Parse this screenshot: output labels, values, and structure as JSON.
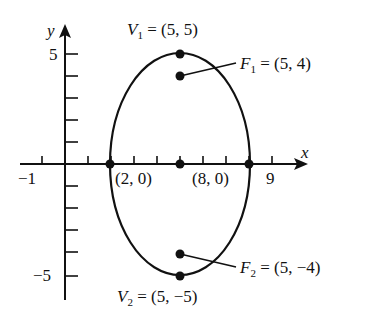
{
  "diagram": {
    "type": "ellipse-on-axes",
    "axes": {
      "x_label": "x",
      "y_label": "y",
      "x_tick_labels": [
        {
          "value": -1,
          "text": "−1"
        },
        {
          "value": 9,
          "text": "9"
        }
      ],
      "y_tick_labels": [
        {
          "value": 5,
          "text": "5"
        },
        {
          "value": -5,
          "text": "−5"
        }
      ],
      "x_range": [
        -1,
        9
      ],
      "y_range": [
        -5,
        5
      ]
    },
    "ellipse": {
      "center": [
        5,
        0
      ],
      "semi_major_vertical": 5,
      "semi_minor_horizontal": 3
    },
    "points": {
      "V1": {
        "label_var": "V",
        "label_sub": "1",
        "label_rest": " = (5, 5)",
        "x": 5,
        "y": 5
      },
      "F1": {
        "label_var": "F",
        "label_sub": "1",
        "label_rest": " = (5, 4)",
        "x": 5,
        "y": 4
      },
      "F2": {
        "label_var": "F",
        "label_sub": "2",
        "label_rest": " = (5, −4)",
        "x": 5,
        "y": -4
      },
      "V2": {
        "label_var": "V",
        "label_sub": "2",
        "label_rest": " = (5, −5)",
        "x": 5,
        "y": -5
      },
      "left": {
        "label": "(2, 0)",
        "x": 2,
        "y": 0
      },
      "right": {
        "label": "(8, 0)",
        "x": 8,
        "y": 0
      },
      "center": {
        "x": 5,
        "y": 0
      }
    }
  }
}
